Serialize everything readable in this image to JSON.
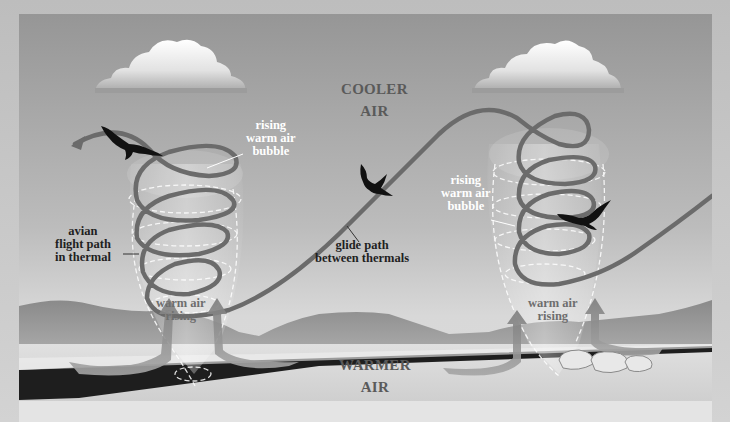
{
  "diagram": {
    "labels": {
      "cooler_air": [
        "COOLER",
        "AIR"
      ],
      "warmer_air": [
        "WARMER",
        "AIR"
      ],
      "left_bubble": [
        "rising",
        "warm air",
        "bubble"
      ],
      "right_bubble": [
        "rising",
        "warm air",
        "bubble"
      ],
      "left_rising": [
        "warm air",
        "rising"
      ],
      "right_rising": [
        "warm air",
        "rising"
      ],
      "flight_path": [
        "avian",
        "flight path",
        "in thermal"
      ],
      "glide_path": [
        "glide path",
        "between thermals"
      ]
    },
    "elements": {
      "clouds": 2,
      "birds": 3,
      "thermals": 2,
      "ground_arrows": 4
    },
    "colors": {
      "sky_top": "#9a9a9a",
      "sky_bottom": "#d6d6d6",
      "flight_path": "#6b6b6b",
      "mountains": "#8f8f8f",
      "ground": "#d9d9d9",
      "shadow_road": "#1e1e1e",
      "cloud": "#f4f4f4",
      "bird": "#111111"
    }
  }
}
